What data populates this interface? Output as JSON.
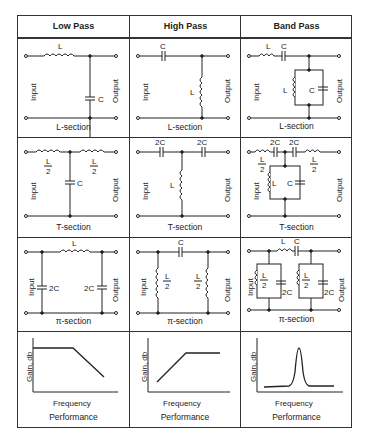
{
  "table": {
    "columns": [
      {
        "header": "Low Pass"
      },
      {
        "header": "High Pass"
      },
      {
        "header": "Band Pass"
      }
    ],
    "rows": [
      {
        "type": "L-section",
        "captions": [
          "L-section",
          "L-section",
          "L-section"
        ]
      },
      {
        "type": "T-section",
        "captions": [
          "T-section",
          "T-section",
          "T-section"
        ]
      },
      {
        "type": "pi-section",
        "captions": [
          "π-section",
          "π-section",
          "π-section"
        ]
      },
      {
        "type": "performance",
        "captions": [
          "Performance",
          "Performance",
          "Performance"
        ]
      }
    ]
  },
  "labels": {
    "input": "Input",
    "output": "Output",
    "L": "L",
    "C": "C",
    "twoC": "2C",
    "half": "2",
    "gain_axis": "Gain, db",
    "freq_axis": "Frequency"
  }
}
